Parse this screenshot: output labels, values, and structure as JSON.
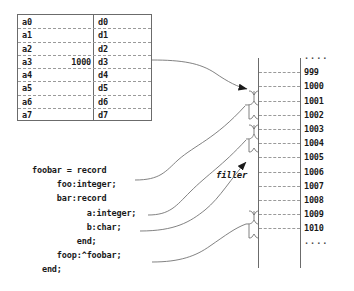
{
  "register_table": {
    "rows": [
      {
        "addr": "a0",
        "value": "",
        "data": "d0"
      },
      {
        "addr": "a1",
        "value": "",
        "data": "d1"
      },
      {
        "addr": "a2",
        "value": "",
        "data": "d2"
      },
      {
        "addr": "a3",
        "value": "1000",
        "data": "d3"
      },
      {
        "addr": "a4",
        "value": "",
        "data": "d4"
      },
      {
        "addr": "a5",
        "value": "",
        "data": "d5"
      },
      {
        "addr": "a6",
        "value": "",
        "data": "d6"
      },
      {
        "addr": "a7",
        "value": "",
        "data": "d7"
      }
    ]
  },
  "code": {
    "lines": [
      "foobar = record",
      "     foo:integer;",
      "     bar:record",
      "           a:integer;",
      "           b:char;",
      "         end;",
      "     foop:^foobar;",
      "  end;"
    ]
  },
  "labels": {
    "filler": "filler"
  },
  "memory_column": {
    "rows": [
      {
        "address": "....",
        "is_ellipsis": true
      },
      {
        "address": "999",
        "is_ellipsis": false
      },
      {
        "address": "1000",
        "is_ellipsis": false
      },
      {
        "address": "1001",
        "is_ellipsis": false
      },
      {
        "address": "1002",
        "is_ellipsis": false
      },
      {
        "address": "1003",
        "is_ellipsis": false
      },
      {
        "address": "1004",
        "is_ellipsis": false
      },
      {
        "address": "1005",
        "is_ellipsis": false
      },
      {
        "address": "1006",
        "is_ellipsis": false
      },
      {
        "address": "1007",
        "is_ellipsis": false
      },
      {
        "address": "1008",
        "is_ellipsis": false
      },
      {
        "address": "1009",
        "is_ellipsis": false
      },
      {
        "address": "1010",
        "is_ellipsis": false
      },
      {
        "address": "....",
        "is_ellipsis": true
      }
    ]
  },
  "colors": {
    "line": "#6b6b6b",
    "dash": "#9a9a9a",
    "text": "#1a1a1a",
    "background": "#ffffff"
  }
}
